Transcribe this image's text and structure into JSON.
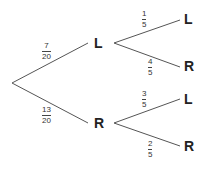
{
  "diagram": {
    "type": "probability-tree",
    "line_color": "#555555",
    "first_stage": [
      {
        "node": "L",
        "num": "7",
        "den": "20"
      },
      {
        "node": "R",
        "num": "13",
        "den": "20"
      }
    ],
    "second_stage": {
      "from_L": [
        {
          "node": "L",
          "num": "1",
          "den": "5"
        },
        {
          "node": "R",
          "num": "4",
          "den": "5"
        }
      ],
      "from_R": [
        {
          "node": "L",
          "num": "3",
          "den": "5"
        },
        {
          "node": "R",
          "num": "2",
          "den": "5"
        }
      ]
    }
  }
}
